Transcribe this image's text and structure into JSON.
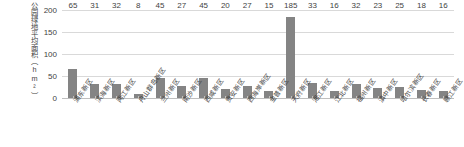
{
  "chart_data": {
    "type": "bar",
    "title": "",
    "xlabel": "",
    "ylabel": "公园绿地平均面积（hm²）",
    "ylim": [
      0,
      200
    ],
    "yticks": [
      200,
      150,
      100,
      50,
      0
    ],
    "grid": true,
    "legend": "none",
    "bar_color": "#848484",
    "gridline_color": "#d9d9d9",
    "categories": [
      "浦东新区",
      "滨海新区",
      "两江新区",
      "舟山群岛新区",
      "兰州新区",
      "南沙新区",
      "西咸新区",
      "贵安新区",
      "西海岸新区",
      "金普新区",
      "天府新区",
      "湘江新区",
      "江北新区",
      "福州新区",
      "滇中新区",
      "哈尔滨新区",
      "长春新区",
      "赣江新区"
    ],
    "values": [
      65,
      31,
      32,
      8,
      45,
      27,
      45,
      20,
      27,
      15,
      185,
      33,
      16,
      32,
      23,
      25,
      18,
      16
    ],
    "data_labels": [
      "65",
      "31",
      "32",
      "8",
      "45",
      "27",
      "45",
      "20",
      "27",
      "15",
      "185",
      "33",
      "16",
      "32",
      "23",
      "25",
      "18",
      "16"
    ]
  }
}
